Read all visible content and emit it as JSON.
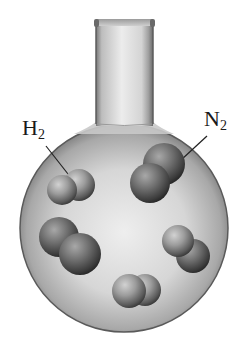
{
  "figure": {
    "labels": [
      {
        "id": "h2",
        "element": "H",
        "subscript": "2",
        "target": "top-left molecule"
      },
      {
        "id": "n2",
        "element": "N",
        "subscript": "2",
        "target": "top-right molecule"
      }
    ],
    "molecule_count": 5,
    "colors": {
      "background": "#ffffff",
      "glass_light": "#e6e6e6",
      "glass_mid": "#bdbdbd",
      "glass_edge": "#5a5a5a",
      "molecule_light": "#b5b5b5",
      "molecule_dark": "#3a3a3a",
      "text": "#1a1a1a"
    }
  }
}
